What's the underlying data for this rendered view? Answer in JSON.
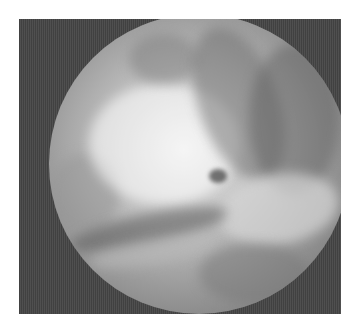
{
  "image": {
    "description": "Grayscale arthroscopic/endoscopic view: circular field of view inside a dark square frame",
    "colors": {
      "frame": "#4a4a4a",
      "background": "#ffffff",
      "highlight": "#e8e8e8",
      "shadow": "#6a6a6a"
    }
  }
}
